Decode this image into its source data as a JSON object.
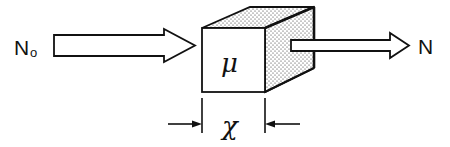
{
  "diagram": {
    "incident_label": {
      "main": "N",
      "subscript": "o"
    },
    "transmitted_label": "N",
    "material_label": "μ",
    "thickness_label": "χ",
    "colors": {
      "stroke": "#111111",
      "background": "#ffffff",
      "stipple": "#222222"
    }
  }
}
